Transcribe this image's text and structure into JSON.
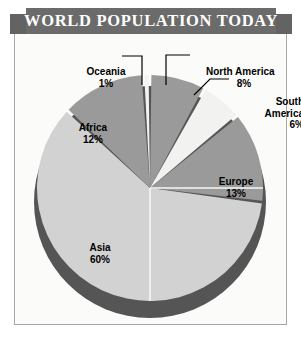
{
  "banner": {
    "title": "WORLD POPULATION TODAY"
  },
  "colors": {
    "banner_bg": "#6b6b6b",
    "banner_text": "#ffffff",
    "panel_bg": "#fbfbf9",
    "panel_border": "#a8a8a4",
    "wedge_light": "#d2d2d2",
    "wedge_mid": "#9a9a9a",
    "wedge_white": "#f2f2f0",
    "pie_shadow": "#555555",
    "leader_line": "#000000",
    "label_text": "#000000"
  },
  "labels": {
    "oceania": {
      "name": "Oceania",
      "pct": "1%"
    },
    "north_america": {
      "name": "North America",
      "pct": "8%"
    },
    "south_america": {
      "name": "South",
      "name2": "America",
      "pct": "6%"
    },
    "africa": {
      "name": "Africa",
      "pct": "12%"
    },
    "europe": {
      "name": "Europe",
      "pct": "13%"
    },
    "asia": {
      "name": "Asia",
      "pct": "60%"
    }
  },
  "chart_data": {
    "type": "pie",
    "title": "WORLD POPULATION TODAY",
    "xlabel": "",
    "ylabel": "",
    "legend_position": "none",
    "labels_inline": true,
    "categories": [
      "Asia",
      "Europe",
      "Africa",
      "North America",
      "South America",
      "Oceania"
    ],
    "values": [
      60,
      13,
      12,
      8,
      6,
      1
    ],
    "value_labels": [
      "60%",
      "13%",
      "12%",
      "8%",
      "6%",
      "1%"
    ],
    "units": "percent",
    "total": 100,
    "slice_colors": [
      "#d2d2d2",
      "#9a9a9a",
      "#9a9a9a",
      "#9a9a9a",
      "#f2f2f0",
      "#f2f2f0"
    ],
    "start_angle_deg": -90,
    "direction": "clockwise",
    "annotations": [
      "Oceania 1%",
      "North America 8%",
      "South America 6%",
      "Europe 13%",
      "Asia 60%",
      "Africa 12%"
    ]
  }
}
